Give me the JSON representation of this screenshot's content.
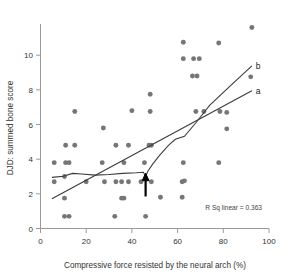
{
  "chart_data": {
    "type": "scatter",
    "title": "",
    "xlabel": "Compressive force resisted by the neural arch (%)",
    "ylabel": "DJD: summed bone score",
    "xlim": [
      0,
      100
    ],
    "ylim": [
      0,
      11.8
    ],
    "xticks": [
      0,
      20,
      40,
      60,
      80,
      100
    ],
    "yticks": [
      0,
      2,
      4,
      6,
      8,
      10
    ],
    "xtick_labels": [
      "0",
      "20",
      "40",
      "60",
      "80",
      "100"
    ],
    "ytick_labels": [
      "0",
      "2",
      "4",
      "6",
      "8",
      "10"
    ],
    "grid": false,
    "legend": "none",
    "marker_color": "#767676",
    "line_color": "#3a3a3a",
    "annotation": "R Sq linear = 0.363",
    "r_squared": 0.363,
    "points": [
      [
        6.0,
        2.7
      ],
      [
        6.0,
        3.8
      ],
      [
        10.5,
        1.75
      ],
      [
        10.5,
        0.7
      ],
      [
        12.5,
        0.7
      ],
      [
        10.5,
        3.0
      ],
      [
        11.0,
        3.8
      ],
      [
        12.5,
        3.8
      ],
      [
        11.0,
        4.8
      ],
      [
        15.0,
        4.8
      ],
      [
        15.0,
        6.75
      ],
      [
        20.0,
        2.7
      ],
      [
        27.0,
        3.8
      ],
      [
        27.5,
        5.8
      ],
      [
        28.0,
        2.7
      ],
      [
        32.5,
        0.7
      ],
      [
        33.0,
        2.7
      ],
      [
        33.0,
        4.8
      ],
      [
        35.5,
        1.75
      ],
      [
        36.5,
        1.75
      ],
      [
        35.5,
        2.7
      ],
      [
        36.5,
        3.8
      ],
      [
        38.5,
        2.7
      ],
      [
        38.5,
        4.8
      ],
      [
        40.0,
        6.8
      ],
      [
        44.0,
        2.7
      ],
      [
        45.5,
        3.8
      ],
      [
        46.0,
        0.7
      ],
      [
        47.5,
        4.8
      ],
      [
        48.5,
        4.8
      ],
      [
        48.0,
        6.75
      ],
      [
        48.0,
        7.75
      ],
      [
        48.5,
        2.7
      ],
      [
        52.5,
        1.8
      ],
      [
        62.0,
        1.8
      ],
      [
        62.0,
        2.7
      ],
      [
        63.0,
        2.75
      ],
      [
        62.5,
        3.8
      ],
      [
        62.5,
        9.8
      ],
      [
        62.5,
        10.75
      ],
      [
        66.5,
        8.8
      ],
      [
        68.5,
        8.8
      ],
      [
        67.0,
        9.8
      ],
      [
        69.5,
        9.8
      ],
      [
        68.0,
        6.75
      ],
      [
        71.5,
        6.75
      ],
      [
        78.0,
        3.8
      ],
      [
        78.0,
        10.7
      ],
      [
        78.5,
        6.75
      ],
      [
        81.5,
        6.7
      ],
      [
        81.5,
        5.75
      ],
      [
        92.0,
        8.75
      ],
      [
        92.5,
        11.6
      ]
    ],
    "fit_lines": [
      {
        "name": "a",
        "kind": "linear",
        "label": "a",
        "points": [
          [
            5.0,
            1.72
          ],
          [
            92.5,
            7.95
          ]
        ]
      },
      {
        "name": "b",
        "kind": "loess",
        "label": "b",
        "points": [
          [
            5.0,
            2.95
          ],
          [
            10.0,
            3.02
          ],
          [
            14.0,
            3.18
          ],
          [
            18.0,
            3.14
          ],
          [
            24.0,
            3.08
          ],
          [
            30.0,
            3.12
          ],
          [
            36.0,
            3.18
          ],
          [
            42.0,
            3.22
          ],
          [
            45.0,
            3.25
          ],
          [
            46.0,
            3.02
          ],
          [
            47.0,
            3.3
          ],
          [
            49.0,
            3.7
          ],
          [
            52.0,
            4.2
          ],
          [
            56.0,
            4.8
          ],
          [
            59.0,
            5.15
          ],
          [
            63.0,
            5.32
          ],
          [
            68.0,
            6.1
          ],
          [
            74.0,
            7.1
          ],
          [
            82.0,
            8.1
          ],
          [
            92.5,
            9.38
          ]
        ]
      }
    ],
    "arrow": {
      "x": 46.0,
      "y_tail": 1.85,
      "y_head": 3.05,
      "color": "#000000"
    }
  }
}
